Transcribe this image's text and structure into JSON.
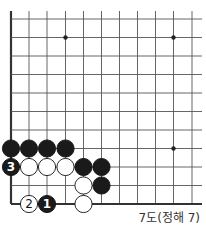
{
  "diagram": {
    "caption": "7도(정해 7)",
    "colors": {
      "line": "#555555",
      "edge": "#333333",
      "black": "#1a1a1a",
      "white": "#ffffff",
      "star": "#222222"
    },
    "grid": {
      "xs": [
        11,
        29,
        47,
        65.5,
        83.5,
        101.5,
        119.5,
        137.5,
        155.5,
        173.5,
        192
      ],
      "ys": [
        19,
        37.5,
        56,
        74.5,
        93,
        111.5,
        130,
        148.5,
        167,
        185.5,
        204
      ],
      "top": 11,
      "right": 202,
      "left_edge": 11,
      "bottom_edge": 204
    },
    "star_points": [
      {
        "col": 3,
        "row": 1
      },
      {
        "col": 9,
        "row": 1
      },
      {
        "col": 9,
        "row": 7
      }
    ],
    "stones": [
      {
        "col": 0,
        "row": 7,
        "color": "black",
        "label": ""
      },
      {
        "col": 1,
        "row": 7,
        "color": "black",
        "label": ""
      },
      {
        "col": 2,
        "row": 7,
        "color": "black",
        "label": ""
      },
      {
        "col": 3,
        "row": 7,
        "color": "black",
        "label": ""
      },
      {
        "col": 0,
        "row": 8,
        "color": "black",
        "label": "3"
      },
      {
        "col": 1,
        "row": 8,
        "color": "white",
        "label": ""
      },
      {
        "col": 2,
        "row": 8,
        "color": "white",
        "label": ""
      },
      {
        "col": 3,
        "row": 8,
        "color": "white",
        "label": ""
      },
      {
        "col": 4,
        "row": 8,
        "color": "black",
        "label": ""
      },
      {
        "col": 5,
        "row": 8,
        "color": "black",
        "label": ""
      },
      {
        "col": 4,
        "row": 9,
        "color": "white",
        "label": ""
      },
      {
        "col": 5,
        "row": 9,
        "color": "black",
        "label": ""
      },
      {
        "col": 1,
        "row": 10,
        "color": "white",
        "label": "2"
      },
      {
        "col": 2,
        "row": 10,
        "color": "black",
        "label": "1"
      },
      {
        "col": 4,
        "row": 10,
        "color": "white",
        "label": ""
      }
    ]
  }
}
